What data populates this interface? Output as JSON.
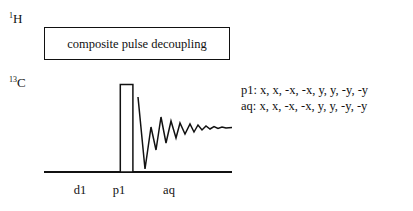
{
  "diagram": {
    "channels": [
      {
        "name": "proton-channel",
        "isotope": "1",
        "element": "H"
      },
      {
        "name": "carbon-channel",
        "isotope": "13",
        "element": "C"
      }
    ],
    "decoupling": {
      "label": "composite pulse decoupling"
    },
    "timing_labels": [
      {
        "key": "d1",
        "label": "d1"
      },
      {
        "key": "p1",
        "label": "p1"
      },
      {
        "key": "aq",
        "label": "aq"
      }
    ],
    "phase_cycle": [
      {
        "key": "p1",
        "label": "p1: x, x, -x, -x, y, y, -y, -y"
      },
      {
        "key": "aq",
        "label": "aq: x, x, -x, -x, y, y, -y, -y"
      }
    ],
    "colors": {
      "stroke": "#111111",
      "background": "#ffffff"
    }
  }
}
